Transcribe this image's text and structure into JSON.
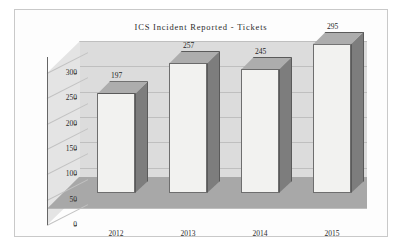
{
  "chart_data": {
    "type": "bar",
    "title": "ICS Incident Reported - Tickets",
    "xlabel": "",
    "ylabel": "",
    "categories": [
      "2012",
      "2013",
      "2014",
      "2015"
    ],
    "values": [
      197,
      257,
      245,
      295
    ],
    "ylim": [
      0,
      300
    ],
    "yticks": [
      0,
      50,
      100,
      150,
      200,
      250,
      300
    ],
    "ytick_labels": [
      "0",
      "50",
      "100",
      "150",
      "200",
      "250",
      "300"
    ],
    "grid": true,
    "legend": false,
    "style": "3d-bar",
    "colors": {
      "bar_front": "#f2f2f0",
      "bar_side": "#7d7d7d",
      "bar_top": "#adadad",
      "back_wall": "#dcdcdc",
      "left_wall": "#e4e4e4",
      "floor": "#a8a8a8",
      "gridline": "#bfbfbf",
      "border": "#c9c9c9",
      "text": "#2b2b2b"
    }
  }
}
